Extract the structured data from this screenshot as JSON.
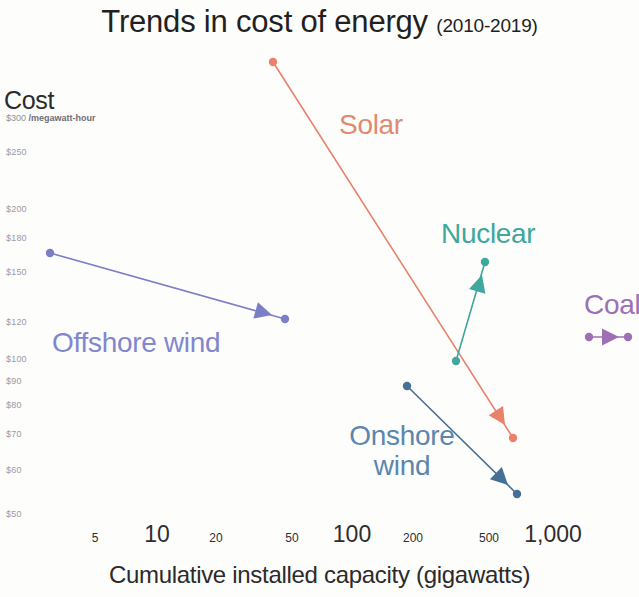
{
  "title": {
    "main": "Trends in cost of energy ",
    "sub": "(2010-2019)"
  },
  "axes": {
    "y_title": "Cost",
    "y_units_value": "$300",
    "y_units_label": "/megawatt-hour",
    "x_title": "Cumulative installed capacity (gigawatts)"
  },
  "chart_data": {
    "type": "scatter",
    "title": "Trends in cost of energy (2010-2019)",
    "subtitle": "(2010-2019)",
    "xlabel": "Cumulative installed capacity (gigawatts)",
    "ylabel": "Cost ($/megawatt-hour)",
    "xscale": "log",
    "yscale": "log",
    "xlim": [
      4,
      1300
    ],
    "ylim": [
      45,
      310
    ],
    "grid": false,
    "legend": "inline-labels",
    "xticks": [
      {
        "value": 5,
        "label": "5",
        "px": 95,
        "size": "minor"
      },
      {
        "value": 10,
        "label": "10",
        "px": 157,
        "size": "major"
      },
      {
        "value": 20,
        "label": "20",
        "px": 216,
        "size": "minor"
      },
      {
        "value": 50,
        "label": "50",
        "px": 292,
        "size": "minor"
      },
      {
        "value": 100,
        "label": "100",
        "px": 352,
        "size": "major"
      },
      {
        "value": 200,
        "label": "200",
        "px": 413,
        "size": "minor"
      },
      {
        "value": 500,
        "label": "500",
        "px": 489,
        "size": "minor"
      },
      {
        "value": 1000,
        "label": "1,000",
        "px": 553,
        "size": "major"
      }
    ],
    "yticks": [
      {
        "value": 300,
        "label": "$300",
        "px": 113
      },
      {
        "value": 250,
        "label": "$250",
        "px": 152
      },
      {
        "value": 200,
        "label": "$200",
        "px": 209
      },
      {
        "value": 180,
        "label": "$180",
        "px": 238
      },
      {
        "value": 150,
        "label": "$150",
        "px": 272
      },
      {
        "value": 120,
        "label": "$120",
        "px": 322
      },
      {
        "value": 100,
        "label": "$100",
        "px": 359
      },
      {
        "value": 90,
        "label": "$90",
        "px": 381
      },
      {
        "value": 80,
        "label": "$80",
        "px": 405
      },
      {
        "value": 70,
        "label": "$70",
        "px": 434
      },
      {
        "value": 60,
        "label": "$60",
        "px": 470
      },
      {
        "value": 50,
        "label": "$50",
        "px": 514
      }
    ],
    "series": [
      {
        "name": "Solar",
        "color": "#e8826a",
        "label_color": "#e08a72",
        "start": {
          "year": 2010,
          "capacity": 40,
          "cost": 305
        },
        "end": {
          "year": 2019,
          "capacity": 580,
          "cost": 68
        },
        "start_px": [
          273,
          62
        ],
        "end_px": [
          513,
          438
        ],
        "arrow_px": [
          505,
          425
        ],
        "direction": "down-right"
      },
      {
        "name": "Offshore wind",
        "color": "#7b7fc6",
        "label_color": "#8286ce",
        "start": {
          "year": 2010,
          "capacity": 3,
          "cost": 162
        },
        "end": {
          "year": 2019,
          "capacity": 28,
          "cost": 121
        },
        "start_px": [
          50,
          253
        ],
        "end_px": [
          285,
          319
        ],
        "arrow_px": [
          272,
          315
        ],
        "direction": "right-slight-down"
      },
      {
        "name": "Nuclear",
        "color": "#3fa79b",
        "label_color": "#3fa79b",
        "start": {
          "year": 2010,
          "capacity": 300,
          "cost": 100
        },
        "end": {
          "year": 2019,
          "capacity": 450,
          "cost": 155
        },
        "start_px": [
          456,
          361
        ],
        "end_px": [
          485,
          262
        ],
        "arrow_px": [
          482,
          275
        ],
        "direction": "up"
      },
      {
        "name": "Onshore wind",
        "color": "#466f96",
        "label_color": "#5b86ad",
        "start": {
          "year": 2010,
          "capacity": 180,
          "cost": 88
        },
        "end": {
          "year": 2019,
          "capacity": 620,
          "cost": 53
        },
        "start_px": [
          407,
          386
        ],
        "end_px": [
          517,
          494
        ],
        "arrow_px": [
          508,
          485
        ],
        "direction": "down-right"
      },
      {
        "name": "Coal",
        "color": "#9f6fb5",
        "label_color": "#9f6fb5",
        "start": {
          "year": 2010,
          "capacity": 1050,
          "cost": 112
        },
        "end": {
          "year": 2019,
          "capacity": 1250,
          "cost": 112
        },
        "start_px": [
          589,
          337
        ],
        "end_px": [
          628,
          337
        ],
        "arrow_px": [
          619,
          337
        ],
        "direction": "right"
      }
    ]
  },
  "series_labels": {
    "solar": "Solar",
    "nuclear": "Nuclear",
    "coal": "Coal",
    "offshore": "Offshore wind",
    "onshore_line1": "Onshore",
    "onshore_line2": "wind"
  }
}
